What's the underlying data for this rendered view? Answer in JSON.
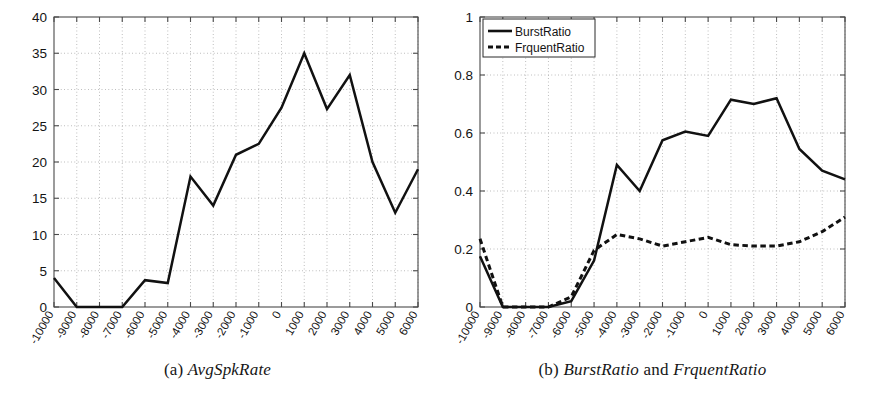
{
  "figure": {
    "background": "#ffffff",
    "line_color": "#111111",
    "grid_color": "#9a9a9a",
    "axis_color": "#4a4a4a"
  },
  "panels": [
    {
      "id": "a",
      "caption_label": "(a)",
      "caption_text": "AvgSpkRate",
      "caption_full": "(a) AvgSpkRate"
    },
    {
      "id": "b",
      "caption_label": "(b)",
      "caption_text_1": "BurstRatio",
      "caption_conjunction": "and",
      "caption_text_2": "FrquentRatio",
      "caption_full": "(b) BurstRatio and FrquentRatio"
    }
  ],
  "legend": {
    "position": "top-left",
    "items": [
      {
        "label": "BurstRatio",
        "style": "solid"
      },
      {
        "label": "FrquentRatio",
        "style": "dashed"
      }
    ]
  },
  "chart_data": [
    {
      "type": "line",
      "title": "(a) AvgSpkRate",
      "xlabel": "",
      "ylabel": "",
      "grid": true,
      "legend": false,
      "xlim": [
        -10000,
        6000
      ],
      "ylim": [
        0,
        40
      ],
      "yticks": [
        0,
        5,
        10,
        15,
        20,
        25,
        30,
        35,
        40
      ],
      "ytick_labels": [
        "0",
        "5",
        "10",
        "15",
        "20",
        "25",
        "30",
        "35",
        "40"
      ],
      "categories": [
        -10000,
        -9000,
        -8000,
        -7000,
        -6000,
        -5000,
        -4000,
        -3000,
        -2000,
        -1000,
        0,
        1000,
        2000,
        3000,
        4000,
        5000,
        6000
      ],
      "xtick_labels": [
        "-10000",
        "-9000",
        "-8000",
        "-7000",
        "-6000",
        "-5000",
        "-4000",
        "-3000",
        "-2000",
        "-1000",
        "0",
        "1000",
        "2000",
        "3000",
        "4000",
        "5000",
        "6000"
      ],
      "series": [
        {
          "name": "AvgSpkRate",
          "style": "solid",
          "values": [
            4.0,
            0.0,
            0.0,
            0.0,
            3.7,
            3.3,
            18.0,
            14.0,
            21.0,
            22.5,
            27.5,
            35.0,
            27.3,
            32.0,
            20.0,
            13.0,
            19.0
          ]
        }
      ]
    },
    {
      "type": "line",
      "title": "(b) BurstRatio and FrquentRatio",
      "xlabel": "",
      "ylabel": "",
      "grid": true,
      "legend": true,
      "legend_position": "upper-left",
      "xlim": [
        -10000,
        6000
      ],
      "ylim": [
        0,
        1
      ],
      "yticks": [
        0,
        0.2,
        0.4,
        0.6,
        0.8,
        1
      ],
      "ytick_labels": [
        "0",
        "0.2",
        "0.4",
        "0.6",
        "0.8",
        "1"
      ],
      "categories": [
        -10000,
        -9000,
        -8000,
        -7000,
        -6000,
        -5000,
        -4000,
        -3000,
        -2000,
        -1000,
        0,
        1000,
        2000,
        3000,
        4000,
        5000,
        6000
      ],
      "xtick_labels": [
        "-10000",
        "-9000",
        "-8000",
        "-7000",
        "-6000",
        "-5000",
        "-4000",
        "-3000",
        "-2000",
        "-1000",
        "0",
        "1000",
        "2000",
        "3000",
        "4000",
        "5000",
        "6000"
      ],
      "series": [
        {
          "name": "BurstRatio",
          "style": "solid",
          "values": [
            0.175,
            0.0,
            0.0,
            0.0,
            0.02,
            0.16,
            0.49,
            0.4,
            0.575,
            0.605,
            0.59,
            0.715,
            0.7,
            0.72,
            0.545,
            0.47,
            0.44
          ]
        },
        {
          "name": "FrquentRatio",
          "style": "dashed",
          "values": [
            0.235,
            0.0,
            0.0,
            0.0,
            0.035,
            0.195,
            0.25,
            0.235,
            0.21,
            0.225,
            0.24,
            0.215,
            0.21,
            0.21,
            0.225,
            0.26,
            0.31
          ]
        }
      ]
    }
  ]
}
